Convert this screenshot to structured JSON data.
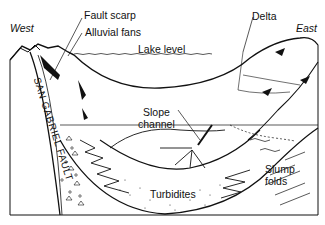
{
  "diagram": {
    "type": "geologic cross-section",
    "labels": {
      "west": "West",
      "east": "East",
      "fault_scarp": "Fault scarp",
      "alluvial_fans": "Alluvial fans",
      "delta": "Delta",
      "lake_level": "Lake level",
      "slope_channel_1": "Slope",
      "slope_channel_2": "channel",
      "turbidites": "Turbidites",
      "slump_folds_1": "Slump",
      "slump_folds_2": "folds",
      "san_gabriel_fault": "SAN GABRIEL FAULT"
    },
    "colors": {
      "line": "#111111",
      "background": "#ffffff"
    }
  }
}
